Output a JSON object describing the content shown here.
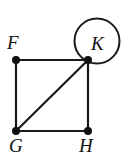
{
  "figure": {
    "name": "graph-with-loop-at-K",
    "width": 133,
    "height": 159,
    "background_color": "#ffffff",
    "stroke_color": "#1a1a1a",
    "vertex_fill_color": "#111111",
    "edge_width": 2,
    "loop_stroke_width": 2,
    "vertex_radius": 4
  },
  "chart_data": {
    "type": "diagram",
    "subtype": "undirected-graph",
    "title": "",
    "vertices": [
      {
        "id": "F",
        "label": "F",
        "x": 16,
        "y": 60,
        "label_x": 7,
        "label_y": 33
      },
      {
        "id": "K",
        "label": "K",
        "x": 88,
        "y": 60,
        "label_x": 91,
        "label_y": 34
      },
      {
        "id": "G",
        "label": "G",
        "x": 16,
        "y": 131,
        "label_x": 9,
        "label_y": 136
      },
      {
        "id": "H",
        "label": "H",
        "x": 88,
        "y": 131,
        "label_x": 79,
        "label_y": 136
      }
    ],
    "edges": [
      {
        "from": "F",
        "to": "K",
        "kind": "straight"
      },
      {
        "from": "F",
        "to": "G",
        "kind": "straight"
      },
      {
        "from": "G",
        "to": "H",
        "kind": "straight"
      },
      {
        "from": "K",
        "to": "H",
        "kind": "straight"
      },
      {
        "from": "G",
        "to": "K",
        "kind": "diagonal"
      },
      {
        "from": "K",
        "to": "K",
        "kind": "loop"
      }
    ],
    "loop": {
      "at_vertex": "K",
      "center_x": 97,
      "center_y": 41,
      "radius": 22.5
    }
  },
  "labels": {
    "F": "F",
    "K": "K",
    "G": "G",
    "H": "H"
  }
}
